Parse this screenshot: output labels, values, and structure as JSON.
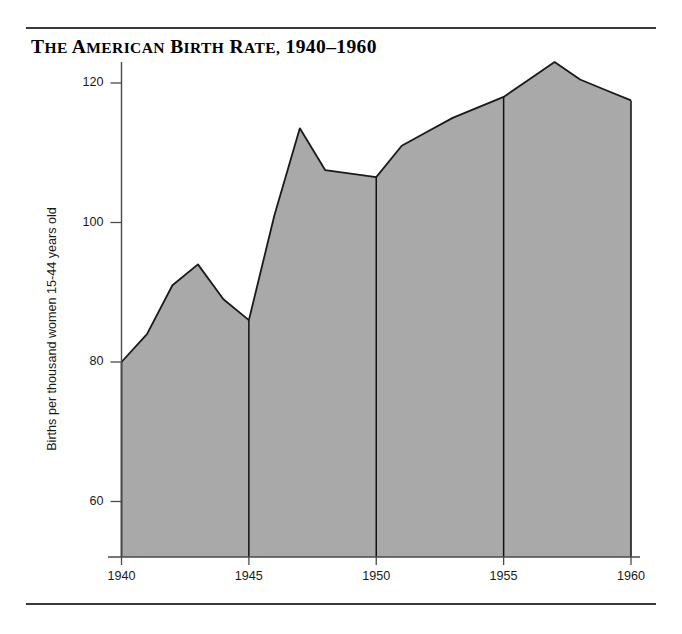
{
  "figure": {
    "title_plain": "THE AMERICAN BIRTH RATE, 1940–1960",
    "title_words": {
      "w1_cap": "T",
      "w1_rest": "HE",
      "w2_cap": "A",
      "w2_rest": "MERICAN",
      "w3_cap": "B",
      "w3_rest": "IRTH",
      "w4_cap": "R",
      "w4_rest": "ATE,",
      "w5_years": "1940–1960"
    },
    "rule_color": "#3a3a3a"
  },
  "chart_data": {
    "type": "area",
    "title": "THE AMERICAN BIRTH RATE, 1940–1960",
    "xlabel": "",
    "ylabel": "Births per thousand women 15-44 years old",
    "x": [
      1940,
      1941,
      1942,
      1943,
      1944,
      1945,
      1946,
      1947,
      1948,
      1949,
      1950,
      1951,
      1952,
      1953,
      1954,
      1955,
      1956,
      1957,
      1958,
      1959,
      1960
    ],
    "values": [
      80,
      84,
      91,
      94,
      89,
      86,
      101,
      113.5,
      107.5,
      107,
      106.5,
      111,
      113,
      115,
      116.5,
      118,
      120.5,
      123,
      120.5,
      119,
      117.5
    ],
    "series": [
      {
        "name": "Births per thousand women 15-44 years old",
        "values": [
          80,
          84,
          91,
          94,
          89,
          86,
          101,
          113.5,
          107.5,
          107,
          106.5,
          111,
          113,
          115,
          116.5,
          118,
          120.5,
          123,
          120.5,
          119,
          117.5
        ]
      }
    ],
    "xlim": [
      1940,
      1960
    ],
    "ylim": [
      53,
      126
    ],
    "xticks": [
      1940,
      1945,
      1950,
      1955,
      1960
    ],
    "xtick_labels": [
      "1940",
      "1945",
      "1950",
      "1955",
      "1960"
    ],
    "yticks": [
      60,
      80,
      100,
      120
    ],
    "ytick_labels": [
      "60",
      "80",
      "100",
      "120"
    ],
    "gridlines": [
      1945,
      1950,
      1955
    ],
    "grid": false,
    "legend": null,
    "fill_color": "#a9a9a9",
    "line_color": "#1a1a1a",
    "axis_color": "#4a4a4a"
  }
}
